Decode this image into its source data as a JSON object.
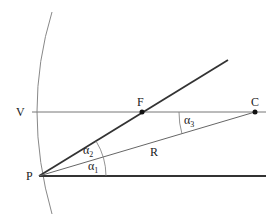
{
  "diagram": {
    "points": {
      "P": {
        "label": "P",
        "x": 39,
        "y": 176
      },
      "V": {
        "label": "V",
        "x": 20,
        "y": 112
      },
      "F": {
        "label": "F",
        "x": 142,
        "y": 112
      },
      "C": {
        "label": "C",
        "x": 255,
        "y": 112
      }
    },
    "segments": {
      "R_label": "R"
    },
    "angles": {
      "alpha1": {
        "symbol": "α",
        "sub": "1"
      },
      "alpha2": {
        "symbol": "α",
        "sub": "2"
      },
      "alpha3": {
        "symbol": "α",
        "sub": "3"
      }
    },
    "colors": {
      "thick_line": "#333333",
      "thin_line": "#666666",
      "arc": "#888888"
    }
  }
}
